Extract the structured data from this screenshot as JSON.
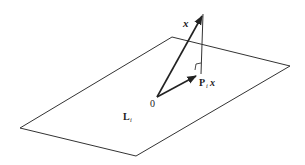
{
  "diagram": {
    "type": "vector-projection-onto-plane",
    "colors": {
      "line": "#333333",
      "background": "#ffffff"
    },
    "plane": {
      "label_main": "L",
      "label_sub": "i",
      "corners": [
        [
          172,
          37
        ],
        [
          290,
          66
        ],
        [
          136,
          156
        ],
        [
          20,
          128
        ]
      ]
    },
    "origin": {
      "label": "0",
      "point": [
        157,
        97
      ]
    },
    "vector_x": {
      "label": "x",
      "from": [
        157,
        97
      ],
      "to": [
        203,
        14
      ]
    },
    "projection": {
      "label_main": "P",
      "label_sub": "i",
      "label_tail": "x",
      "from": [
        157,
        97
      ],
      "to": [
        197,
        75
      ]
    },
    "perpendicular": {
      "from": [
        203,
        14
      ],
      "to": [
        201,
        74
      ]
    },
    "right_angle_marker": true
  }
}
